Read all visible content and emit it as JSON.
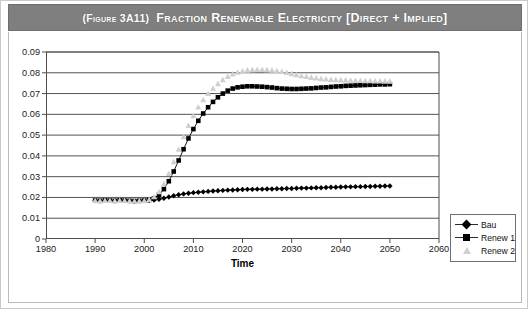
{
  "title": {
    "figure_number": "(Figure 3A11)",
    "text": "Fraction Renewable Electricity [Direct + Implied]",
    "banner_color": "#7f7f7f"
  },
  "legend": {
    "position": "right-middle",
    "items": [
      {
        "label": "Bau",
        "marker": "diamond",
        "color": "#000000",
        "line": true
      },
      {
        "label": "Renew 1",
        "marker": "square",
        "color": "#000000",
        "line": true
      },
      {
        "label": "Renew 2",
        "marker": "triangle",
        "color": "#cfcfcf",
        "line": false
      }
    ]
  },
  "chart_data": {
    "type": "line",
    "title": "Fraction Renewable Electricity [Direct + Implied]",
    "xlabel": "Time",
    "ylabel": "",
    "xlim": [
      1980,
      2060
    ],
    "ylim": [
      0,
      0.09
    ],
    "xticks": [
      1980,
      1990,
      2000,
      2010,
      2020,
      2030,
      2040,
      2050,
      2060
    ],
    "yticks": [
      "0",
      "0.01",
      "0.02",
      "0.03",
      "0.04",
      "0.05",
      "0.06",
      "0.07",
      "0.08",
      "0.09"
    ],
    "grid": "horizontal",
    "x": [
      1990,
      1991,
      1992,
      1993,
      1994,
      1995,
      1996,
      1997,
      1998,
      1999,
      2000,
      2001,
      2002,
      2003,
      2004,
      2005,
      2006,
      2007,
      2008,
      2009,
      2010,
      2011,
      2012,
      2013,
      2014,
      2015,
      2016,
      2017,
      2018,
      2019,
      2020,
      2021,
      2022,
      2023,
      2024,
      2025,
      2026,
      2027,
      2028,
      2029,
      2030,
      2031,
      2032,
      2033,
      2034,
      2035,
      2036,
      2037,
      2038,
      2039,
      2040,
      2041,
      2042,
      2043,
      2044,
      2045,
      2046,
      2047,
      2048,
      2049,
      2050
    ],
    "series": [
      {
        "name": "Bau",
        "marker": "diamond",
        "color": "#000000",
        "values": [
          0.0185,
          0.0184,
          0.0186,
          0.0185,
          0.0184,
          0.0186,
          0.0185,
          0.0184,
          0.0183,
          0.0184,
          0.0185,
          0.0186,
          0.0188,
          0.0191,
          0.0196,
          0.0202,
          0.0208,
          0.0213,
          0.0217,
          0.022,
          0.0223,
          0.0225,
          0.0227,
          0.0229,
          0.0231,
          0.0232,
          0.0234,
          0.0235,
          0.0236,
          0.0237,
          0.0238,
          0.0239,
          0.0239,
          0.024,
          0.024,
          0.0241,
          0.0241,
          0.0242,
          0.0242,
          0.0243,
          0.0243,
          0.0244,
          0.0245,
          0.0245,
          0.0246,
          0.0247,
          0.0247,
          0.0248,
          0.0249,
          0.0249,
          0.025,
          0.0251,
          0.0251,
          0.0252,
          0.0252,
          0.0253,
          0.0253,
          0.0254,
          0.0254,
          0.0255,
          0.0255
        ]
      },
      {
        "name": "Renew 1",
        "marker": "square",
        "color": "#000000",
        "values": [
          0.0185,
          0.0184,
          0.0186,
          0.0185,
          0.0184,
          0.0186,
          0.0185,
          0.0184,
          0.0183,
          0.0184,
          0.0185,
          0.0188,
          0.0196,
          0.0213,
          0.024,
          0.0278,
          0.0325,
          0.0378,
          0.0432,
          0.0484,
          0.0529,
          0.0569,
          0.0604,
          0.0634,
          0.066,
          0.0682,
          0.07,
          0.0714,
          0.0724,
          0.073,
          0.0733,
          0.0735,
          0.0735,
          0.0734,
          0.0733,
          0.0731,
          0.0729,
          0.0726,
          0.0724,
          0.0723,
          0.0722,
          0.0722,
          0.0723,
          0.0724,
          0.0725,
          0.0727,
          0.0729,
          0.073,
          0.0732,
          0.0734,
          0.0735,
          0.0737,
          0.0738,
          0.0739,
          0.074,
          0.0741,
          0.0742,
          0.0743,
          0.0744,
          0.0744,
          0.0745
        ]
      },
      {
        "name": "Renew 2",
        "marker": "triangle",
        "color": "#cfcfcf",
        "values": [
          0.0185,
          0.0184,
          0.0186,
          0.0185,
          0.0184,
          0.0186,
          0.0185,
          0.0184,
          0.0183,
          0.0184,
          0.0185,
          0.019,
          0.0203,
          0.0228,
          0.0266,
          0.0315,
          0.0372,
          0.0432,
          0.0492,
          0.0546,
          0.0594,
          0.0635,
          0.067,
          0.07,
          0.0726,
          0.0748,
          0.0767,
          0.0782,
          0.0794,
          0.0803,
          0.0809,
          0.0813,
          0.0815,
          0.0816,
          0.0816,
          0.0815,
          0.0813,
          0.081,
          0.0806,
          0.0801,
          0.0796,
          0.0791,
          0.0786,
          0.0782,
          0.0778,
          0.0775,
          0.0772,
          0.077,
          0.0768,
          0.0767,
          0.0766,
          0.0765,
          0.0764,
          0.0763,
          0.0763,
          0.0762,
          0.0762,
          0.0761,
          0.0761,
          0.076,
          0.076
        ]
      }
    ]
  }
}
